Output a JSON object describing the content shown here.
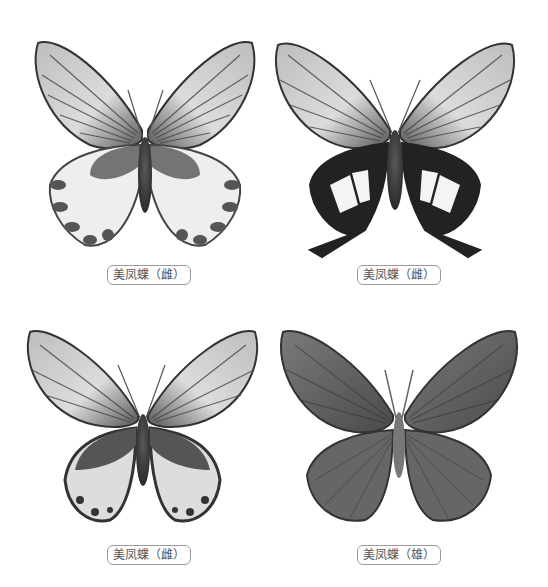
{
  "plate": {
    "specimens": [
      {
        "label": "美凤蝶（雌）",
        "variant": "female-form-1"
      },
      {
        "label": "美凤蝶（雌）",
        "variant": "female-form-2-tailed"
      },
      {
        "label": "美凤蝶（雌）",
        "variant": "female-form-3"
      },
      {
        "label": "美凤蝶（雄）",
        "variant": "male"
      }
    ]
  },
  "colors": {
    "wing_light": "#d8d8d8",
    "wing_mid": "#8a8a8a",
    "wing_dark": "#333333",
    "vein": "#3a3a3a",
    "white_patch": "#f4f4f4",
    "label_border": "#9a9a9a",
    "label_text": "#555555"
  }
}
